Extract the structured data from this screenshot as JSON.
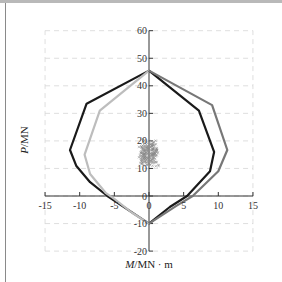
{
  "chart_data": {
    "type": "line",
    "title": "",
    "xlabel": "M/MN · m",
    "ylabel": "P/MN",
    "xlabel_italic": "M",
    "xlabel_rest": "/MN · m",
    "ylabel_italic": "P",
    "ylabel_rest": "/MN",
    "xlim": [
      -15,
      15
    ],
    "ylim": [
      -20,
      60
    ],
    "x_ticks": [
      -15,
      -10,
      -5,
      0,
      5,
      10,
      15
    ],
    "y_ticks": [
      -20,
      -10,
      0,
      10,
      20,
      30,
      40,
      50,
      60
    ],
    "x_tick_labels": [
      "-15",
      "-10",
      "-5",
      "0",
      "5",
      "10",
      "15"
    ],
    "y_tick_labels": [
      "-20",
      "-10",
      "0",
      "10",
      "20",
      "30",
      "40",
      "50",
      "60"
    ],
    "grid": "dashed",
    "legend": "none",
    "series": [
      {
        "name": "interaction-curve-black-left",
        "color": "#1a1a1a",
        "points": [
          [
            0,
            45.5
          ],
          [
            -9.0,
            33.5
          ],
          [
            -11.4,
            16.7
          ],
          [
            -10.5,
            11
          ],
          [
            -8.5,
            5
          ],
          [
            -6,
            0
          ],
          [
            -3,
            -5
          ],
          [
            0,
            -10
          ]
        ]
      },
      {
        "name": "interaction-curve-lightgrey-left",
        "color": "#bdbdbd",
        "points": [
          [
            0,
            45.5
          ],
          [
            -7.1,
            31
          ],
          [
            -9.3,
            15
          ],
          [
            -8.5,
            8
          ],
          [
            -6.2,
            1
          ],
          [
            -5,
            -1
          ],
          [
            -2.5,
            -6
          ],
          [
            0,
            -10
          ]
        ]
      },
      {
        "name": "interaction-curve-black-right",
        "color": "#1a1a1a",
        "points": [
          [
            0,
            45.5
          ],
          [
            7.2,
            31
          ],
          [
            9.4,
            16
          ],
          [
            8.8,
            9
          ],
          [
            5.5,
            0
          ],
          [
            3,
            -4
          ],
          [
            0,
            -10
          ]
        ]
      },
      {
        "name": "interaction-curve-darkgrey-right",
        "color": "#777777",
        "points": [
          [
            0,
            45.5
          ],
          [
            9.1,
            33
          ],
          [
            11.3,
            16.7
          ],
          [
            10,
            9
          ],
          [
            6.3,
            0
          ],
          [
            4,
            -3.5
          ],
          [
            0,
            -10
          ]
        ]
      }
    ],
    "scatter": {
      "name": "load-points-cluster",
      "color": "#8a8a8a",
      "x_range": [
        -1.5,
        1.5
      ],
      "y_range": [
        10,
        21
      ],
      "center": [
        0,
        15
      ]
    }
  }
}
